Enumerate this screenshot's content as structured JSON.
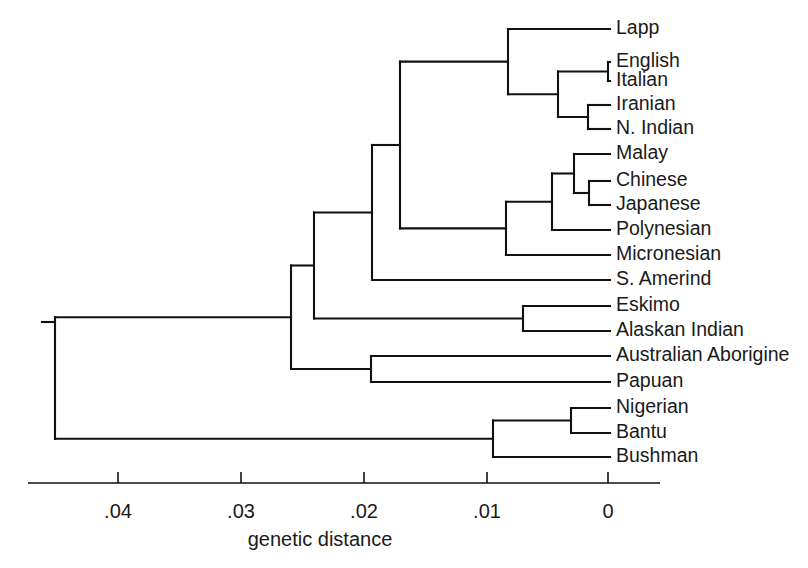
{
  "figure": {
    "type": "phylogenetic-tree",
    "orientation": "right-to-left",
    "axis_title": "genetic distance"
  },
  "axis": {
    "title": "genetic distance",
    "ticks": [
      {
        "value": ".04",
        "x": 118
      },
      {
        "value": ".03",
        "x": 241
      },
      {
        "value": ".02",
        "x": 364
      },
      {
        "value": ".01",
        "x": 487
      },
      {
        "value": "0",
        "x": 608
      }
    ],
    "line_start_x": 28,
    "line_end_x": 660,
    "line_y": 483,
    "tick_height": 11,
    "label_y": 505,
    "title_x": 320,
    "title_y": 538
  },
  "chart_data": {
    "type": "tree",
    "title": "",
    "xlabel": "genetic distance",
    "xlim": [
      0.0,
      0.0455
    ],
    "x_axis_direction": "reversed",
    "scale": {
      "px_per_unit_at_0": 608,
      "px_at_0_04": 118,
      "root_distance": 0.0455
    },
    "leaves": [
      {
        "name": "Lapp",
        "y": 29,
        "tip_x": 610
      },
      {
        "name": "English",
        "y": 62,
        "tip_x": 610
      },
      {
        "name": "Italian",
        "y": 81,
        "tip_x": 610
      },
      {
        "name": "Iranian",
        "y": 105,
        "tip_x": 610
      },
      {
        "name": "N. Indian",
        "y": 129,
        "tip_x": 610
      },
      {
        "name": "Malay",
        "y": 154,
        "tip_x": 610
      },
      {
        "name": "Chinese",
        "y": 181,
        "tip_x": 610
      },
      {
        "name": "Japanese",
        "y": 205,
        "tip_x": 610
      },
      {
        "name": "Polynesian",
        "y": 230,
        "tip_x": 610
      },
      {
        "name": "Micronesian",
        "y": 255,
        "tip_x": 610
      },
      {
        "name": "S. Amerind",
        "y": 280,
        "tip_x": 610
      },
      {
        "name": "Eskimo",
        "y": 306,
        "tip_x": 610
      },
      {
        "name": "Alaskan Indian",
        "y": 331,
        "tip_x": 610
      },
      {
        "name": "Australian Aborigine",
        "y": 356,
        "tip_x": 610
      },
      {
        "name": "Papuan",
        "y": 382,
        "tip_x": 610
      },
      {
        "name": "Nigerian",
        "y": 408,
        "tip_x": 610
      },
      {
        "name": "Bantu",
        "y": 433,
        "tip_x": 610
      },
      {
        "name": "Bushman",
        "y": 457,
        "tip_x": 610
      }
    ],
    "label_x": 616,
    "nodes": [
      {
        "id": "english-italian",
        "x": 608,
        "distance": 0.0,
        "children_y": [
          62,
          81
        ],
        "center_y": 71.5
      },
      {
        "id": "iranian-nindian",
        "x": 588,
        "distance": 0.0016,
        "children_y": [
          105,
          129
        ],
        "center_y": 117
      },
      {
        "id": "caucasoid-core",
        "x": 558,
        "distance": 0.0041,
        "children_y": [
          71.5,
          117
        ],
        "center_y": 94.2
      },
      {
        "id": "caucasoid",
        "x": 508,
        "distance": 0.0081,
        "children_y": [
          29,
          94.2
        ],
        "center_y": 61.6
      },
      {
        "id": "chinese-japanese",
        "x": 589,
        "distance": 0.0015,
        "children_y": [
          181,
          205
        ],
        "center_y": 193
      },
      {
        "id": "malay-sino",
        "x": 574,
        "distance": 0.0028,
        "children_y": [
          154,
          193
        ],
        "center_y": 173.5
      },
      {
        "id": "se-asian",
        "x": 552,
        "distance": 0.0046,
        "children_y": [
          173.5,
          230
        ],
        "center_y": 201.8
      },
      {
        "id": "mongoloid",
        "x": 506,
        "distance": 0.0083,
        "children_y": [
          201.8,
          255
        ],
        "center_y": 228.4
      },
      {
        "id": "eurasian",
        "x": 400,
        "distance": 0.0169,
        "children_y": [
          61.6,
          228.4
        ],
        "center_y": 145
      },
      {
        "id": "eurasian-amerind",
        "x": 372,
        "distance": 0.0192,
        "children_y": [
          145,
          280
        ],
        "center_y": 212.5
      },
      {
        "id": "eskimo-alaskan",
        "x": 523,
        "distance": 0.0069,
        "children_y": [
          306,
          331
        ],
        "center_y": 318.5
      },
      {
        "id": "northeurasian",
        "x": 314,
        "distance": 0.0239,
        "children_y": [
          212.5,
          318.5
        ],
        "center_y": 265.5
      },
      {
        "id": "australian-papuan",
        "x": 371,
        "distance": 0.0193,
        "children_y": [
          356,
          382
        ],
        "center_y": 369
      },
      {
        "id": "non-african",
        "x": 291,
        "distance": 0.0258,
        "children_y": [
          265.5,
          369
        ],
        "center_y": 317.2
      },
      {
        "id": "nigerian-bantu",
        "x": 571,
        "distance": 0.003,
        "children_y": [
          408,
          433
        ],
        "center_y": 420.5
      },
      {
        "id": "african",
        "x": 493,
        "distance": 0.0093,
        "children_y": [
          420.5,
          457
        ],
        "center_y": 438.8
      },
      {
        "id": "root",
        "x": 55,
        "distance": 0.045,
        "children_y": [
          317.2,
          438.8
        ],
        "center_y": 378
      }
    ],
    "root_stub": {
      "x_start": 42,
      "x_end": 55,
      "y": 322
    }
  }
}
